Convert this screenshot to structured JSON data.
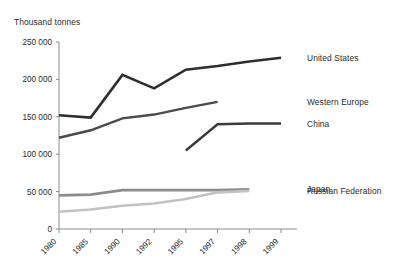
{
  "chart_data": {
    "type": "line",
    "title": "Thousand tonnes",
    "xlabel": "",
    "ylabel": "Thousand tonnes",
    "ylim": [
      0,
      250000
    ],
    "yticks": [
      0,
      50000,
      100000,
      150000,
      200000,
      250000
    ],
    "ytick_labels": [
      "0",
      "50 000",
      "100 000",
      "150 000",
      "200 000",
      "250 000"
    ],
    "categories": [
      "1980",
      "1985",
      "1990",
      "1992",
      "1995",
      "1997",
      "1998",
      "1999"
    ],
    "grid": false,
    "legend_position": "right-inline",
    "series": [
      {
        "name": "United States",
        "color": "#2e2e2e",
        "width": 2.6,
        "values": [
          152000,
          149000,
          206000,
          188000,
          213000,
          218000,
          224000,
          229000
        ]
      },
      {
        "name": "Western Europe",
        "color": "#4a4a4a",
        "width": 2.4,
        "values": [
          122000,
          132000,
          148000,
          153000,
          162000,
          170000,
          null,
          null
        ]
      },
      {
        "name": "China",
        "color": "#3a3a3a",
        "width": 2.4,
        "values": [
          null,
          null,
          null,
          null,
          105000,
          140000,
          141000,
          141000
        ]
      },
      {
        "name": "Japan",
        "color": "#8c8c8c",
        "width": 2.6,
        "values": [
          45000,
          46000,
          52000,
          52000,
          52000,
          52000,
          53000,
          null
        ]
      },
      {
        "name": "Russian Federation",
        "color": "#c2c2c2",
        "width": 2.6,
        "values": [
          23000,
          26000,
          31000,
          34000,
          40000,
          49000,
          51000,
          null
        ]
      }
    ]
  },
  "legend": {
    "items": [
      {
        "label": "United States"
      },
      {
        "label": "Western Europe"
      },
      {
        "label": "China"
      },
      {
        "label": "Japan"
      },
      {
        "label": "Russian Federation"
      }
    ]
  }
}
